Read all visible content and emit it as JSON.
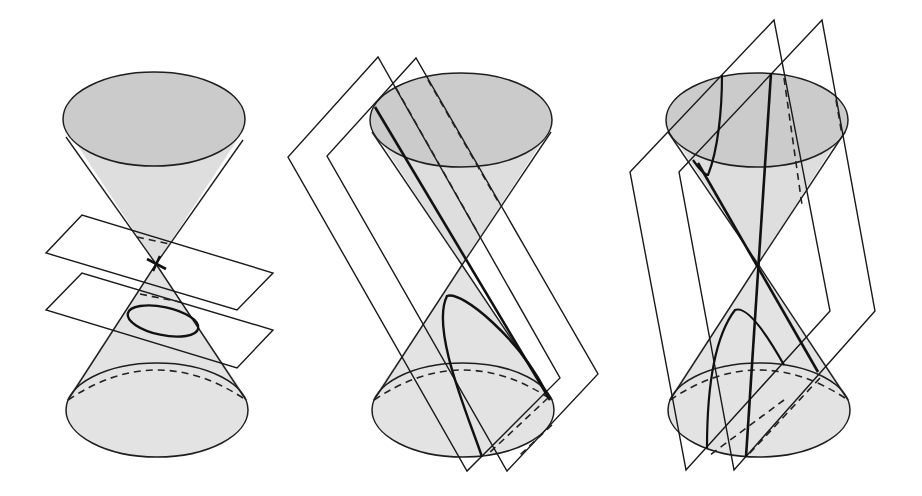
{
  "figure": {
    "title": "",
    "panels": [
      {
        "id": "degenerate-point-and-ellipse",
        "label": ""
      },
      {
        "id": "parabola",
        "label": ""
      },
      {
        "id": "hyperbola",
        "label": ""
      }
    ]
  },
  "colors": {
    "cap_fill": "#c8c8c8",
    "body_fill": "#e0e0e0",
    "line": "#1e1e1e",
    "background": "#ffffff"
  }
}
